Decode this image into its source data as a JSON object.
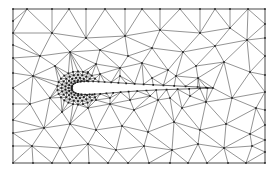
{
  "figure": {
    "title": "Unstructured triangular mesh around an airfoil",
    "type": "cfd-mesh",
    "canvas": {
      "width": 278,
      "height": 173,
      "background": "#ffffff"
    },
    "frame": {
      "x": 13,
      "y": 9,
      "width": 252,
      "height": 154,
      "stroke": "#6b6b6b"
    },
    "style": {
      "edge_color": "#3a3a3a",
      "edge_width": 0.55,
      "node_color": "#1d1d1d",
      "node_radius": 0.85,
      "airfoil_stroke": "#2b2b2b",
      "airfoil_fill": "#ffffff"
    },
    "airfoil": {
      "label": "airfoil",
      "leading_edge": [
        72,
        88
      ],
      "trailing_edge": [
        213,
        88
      ],
      "chord": 141,
      "max_thickness": 12,
      "upper": [
        [
          72.0,
          88.0
        ],
        [
          72.3,
          85.8
        ],
        [
          73.4,
          84.2
        ],
        [
          75.2,
          83.0
        ],
        [
          77.6,
          82.2
        ],
        [
          80.6,
          81.7
        ],
        [
          84.2,
          81.4
        ],
        [
          88.4,
          81.3
        ],
        [
          93.2,
          81.4
        ],
        [
          98.6,
          81.7
        ],
        [
          104.6,
          82.0
        ],
        [
          111.2,
          82.4
        ],
        [
          118.4,
          82.8
        ],
        [
          126.2,
          83.3
        ],
        [
          134.6,
          83.8
        ],
        [
          143.6,
          84.3
        ],
        [
          153.2,
          84.8
        ],
        [
          163.4,
          85.3
        ],
        [
          174.2,
          85.8
        ],
        [
          185.6,
          86.4
        ],
        [
          197.6,
          87.0
        ],
        [
          206.0,
          87.5
        ],
        [
          213.0,
          88.0
        ]
      ],
      "lower": [
        [
          72.0,
          88.0
        ],
        [
          72.4,
          90.4
        ],
        [
          73.6,
          92.0
        ],
        [
          75.6,
          93.2
        ],
        [
          78.2,
          93.9
        ],
        [
          81.4,
          94.3
        ],
        [
          85.2,
          94.5
        ],
        [
          89.6,
          94.4
        ],
        [
          94.6,
          94.2
        ],
        [
          100.2,
          93.8
        ],
        [
          106.4,
          93.3
        ],
        [
          113.2,
          92.8
        ],
        [
          120.6,
          92.2
        ],
        [
          128.6,
          91.6
        ],
        [
          137.2,
          91.0
        ],
        [
          146.4,
          90.5
        ],
        [
          156.2,
          90.0
        ],
        [
          166.6,
          89.6
        ],
        [
          177.6,
          89.2
        ],
        [
          189.2,
          88.8
        ],
        [
          200.0,
          88.4
        ],
        [
          207.5,
          88.2
        ],
        [
          213.0,
          88.0
        ]
      ]
    },
    "boundary_nodes": {
      "top": [
        13,
        27,
        52,
        69,
        86,
        105,
        125,
        142,
        160,
        180,
        200,
        215,
        230,
        248,
        265
      ],
      "bottom": [
        13,
        33,
        52,
        70,
        89,
        108,
        128,
        149,
        170,
        188,
        207,
        228,
        246,
        265
      ],
      "left": [
        9,
        21,
        33,
        45,
        58,
        73,
        88,
        104,
        120,
        133,
        146,
        163
      ],
      "right": [
        9,
        24,
        38,
        56,
        75,
        92,
        110,
        125,
        140,
        152,
        163
      ]
    },
    "interior_nodes": [
      [
        52,
        33
      ],
      [
        86,
        38
      ],
      [
        125,
        36
      ],
      [
        160,
        30
      ],
      [
        200,
        33
      ],
      [
        230,
        28
      ],
      [
        40,
        56
      ],
      [
        70,
        52
      ],
      [
        100,
        50
      ],
      [
        128,
        56
      ],
      [
        152,
        48
      ],
      [
        183,
        52
      ],
      [
        215,
        46
      ],
      [
        247,
        40
      ],
      [
        33,
        76
      ],
      [
        55,
        66
      ],
      [
        96,
        64
      ],
      [
        120,
        68
      ],
      [
        142,
        63
      ],
      [
        168,
        70
      ],
      [
        196,
        66
      ],
      [
        224,
        62
      ],
      [
        250,
        72
      ],
      [
        30,
        104
      ],
      [
        50,
        98
      ],
      [
        62,
        112
      ],
      [
        88,
        108
      ],
      [
        110,
        104
      ],
      [
        134,
        110
      ],
      [
        158,
        100
      ],
      [
        182,
        108
      ],
      [
        206,
        102
      ],
      [
        232,
        98
      ],
      [
        256,
        108
      ],
      [
        44,
        128
      ],
      [
        70,
        124
      ],
      [
        96,
        130
      ],
      [
        122,
        126
      ],
      [
        148,
        132
      ],
      [
        174,
        122
      ],
      [
        200,
        130
      ],
      [
        226,
        124
      ],
      [
        250,
        134
      ],
      [
        32,
        146
      ],
      [
        60,
        148
      ],
      [
        88,
        144
      ],
      [
        116,
        150
      ],
      [
        144,
        146
      ],
      [
        172,
        150
      ],
      [
        198,
        144
      ],
      [
        224,
        148
      ],
      [
        252,
        146
      ],
      [
        152,
        78
      ],
      [
        176,
        76
      ],
      [
        198,
        78
      ],
      [
        120,
        76
      ],
      [
        100,
        74
      ],
      [
        88,
        72
      ],
      [
        130,
        100
      ],
      [
        150,
        96
      ],
      [
        170,
        98
      ],
      [
        190,
        96
      ],
      [
        110,
        98
      ],
      [
        96,
        100
      ]
    ],
    "refined_region": {
      "label": "leading-edge-refinement",
      "center": [
        78,
        88
      ],
      "radius": 17,
      "ring_counts": [
        8,
        12,
        16,
        20,
        24,
        26
      ],
      "ring_radii": [
        3.0,
        5.2,
        7.6,
        10.2,
        13.2,
        16.6
      ]
    }
  }
}
